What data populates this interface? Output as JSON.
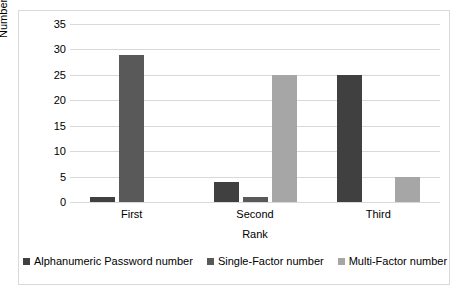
{
  "chart_data": {
    "type": "bar",
    "title": "",
    "xlabel": "Rank",
    "ylabel": "Number of Participants",
    "categories": [
      "First",
      "Second",
      "Third"
    ],
    "series": [
      {
        "name": "Alphanumeric Password number",
        "color": "#404040",
        "values": [
          1,
          4,
          25
        ]
      },
      {
        "name": "Single-Factor number",
        "color": "#595959",
        "values": [
          29,
          1,
          0
        ]
      },
      {
        "name": "Multi-Factor number",
        "color": "#a6a6a6",
        "values": [
          0,
          25,
          5
        ]
      }
    ],
    "ylim": [
      0,
      35
    ],
    "yticks": [
      0,
      5,
      10,
      15,
      20,
      25,
      30,
      35
    ],
    "ytick_labels": [
      "0",
      "5",
      "10",
      "15",
      "20",
      "25",
      "30",
      "35"
    ],
    "grid": "horizontal",
    "legend_position": "bottom",
    "border_color": "#d9d9d9",
    "gridline_color": "#d9d9d9",
    "background": "#ffffff"
  }
}
